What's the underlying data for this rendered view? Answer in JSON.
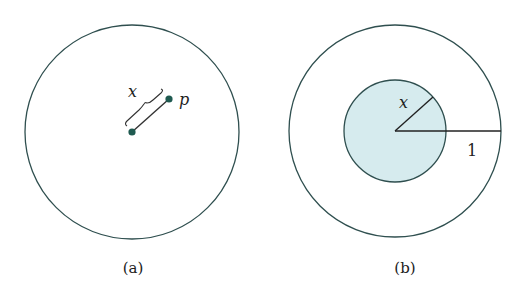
{
  "panels": [
    {
      "caption": "(a)",
      "distance_label": "x",
      "point_label": "p"
    },
    {
      "caption": "(b)",
      "inner_radius_label": "x",
      "outer_radius_label": "1"
    }
  ],
  "colors": {
    "stroke": "#2f4f4f",
    "dot": "#1f5a50",
    "inner_fill": "#d6ebee"
  }
}
